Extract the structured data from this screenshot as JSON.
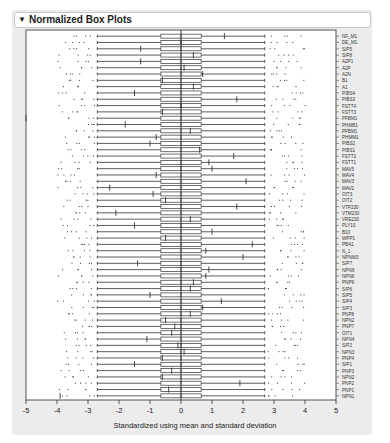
{
  "panel": {
    "title": "Normalized Box Plots",
    "collapse_icon": "disclosure-triangle-down-icon"
  },
  "chart_data": {
    "type": "box",
    "title": "Normalized Box Plots",
    "xlabel": "Standardized using mean and standard deviation",
    "ylabel": "",
    "xlim": [
      -5,
      5
    ],
    "xticks": [
      -5,
      -4,
      -3,
      -2,
      -1,
      0,
      1,
      2,
      3,
      4,
      5
    ],
    "orientation": "horizontal",
    "box": {
      "q1": -0.65,
      "median": 0,
      "q3": 0.65,
      "whisker_low": -2.7,
      "whisker_high": 2.7
    },
    "categories": [
      "NF_M1",
      "DE_M1",
      "S/P5",
      "S/P8",
      "A2P1",
      "A2P",
      "A2N",
      "B1",
      "A1",
      "P/BS4",
      "P/BS3",
      "FSTT4",
      "FSTT3",
      "PFBM1",
      "PHMB1",
      "PFBM1",
      "PHMM1",
      "P/BS2",
      "P/BS1",
      "FSTT2",
      "FSTT1",
      "MAV5",
      "MAV4",
      "MAV3",
      "MAV2",
      "OIT3",
      "OIT2",
      "VTP230",
      "VTM230",
      "VRE230",
      "PLY10",
      "B10",
      "WPP1",
      "PBA1",
      "N_1",
      "NPNW3",
      "S/P7",
      "NPN9",
      "NPN8",
      "PNP9",
      "S/P6",
      "S/P5",
      "S/P4",
      "S/P3",
      "PNP8",
      "NPN2",
      "PNP7",
      "OIT1",
      "NPN4",
      "S/P2",
      "NPN3",
      "PNP4",
      "S/P1",
      "PNP3",
      "NPN2",
      "PNP2",
      "PNP1",
      "NPN1"
    ],
    "mean_markers_x": [
      1.4,
      0.0,
      -1.3,
      0.4,
      -1.3,
      0.1,
      0.7,
      -0.6,
      0.4,
      -1.5,
      1.8,
      0.0,
      -0.6,
      -5.0,
      -1.8,
      0.3,
      -0.8,
      -1.0,
      0.6,
      1.7,
      0.9,
      1.0,
      -0.8,
      2.1,
      -2.3,
      -0.9,
      -0.5,
      1.8,
      -2.1,
      0.3,
      -1.5,
      1.0,
      -0.5,
      2.3,
      0.8,
      2.0,
      -1.4,
      0.9,
      0.8,
      0.4,
      0.3,
      -1.0,
      1.3,
      0.7,
      0.3,
      -0.5,
      -0.2,
      -0.3,
      -1.1,
      -0.1,
      0.1,
      -0.6,
      -1.5,
      -0.3,
      -0.6,
      1.9,
      -0.4,
      -3.9
    ]
  }
}
